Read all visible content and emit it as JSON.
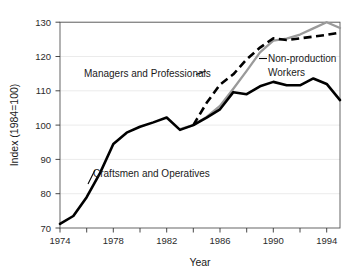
{
  "chart_data": {
    "type": "line",
    "title": "",
    "xlabel": "Year",
    "ylabel": "Index (1984=100)",
    "xlim": [
      1974,
      1995
    ],
    "ylim": [
      70,
      130
    ],
    "grid": true,
    "legend_position": "inline-annotations",
    "x_ticks_major": [
      1974,
      1978,
      1982,
      1986,
      1990,
      1994
    ],
    "x_ticks_minor": [
      1976,
      1980,
      1984,
      1988,
      1992
    ],
    "y_ticks": [
      70,
      80,
      90,
      100,
      110,
      120,
      130
    ],
    "series": [
      {
        "name": "Craftsmen and Operatives",
        "style": "solid",
        "color": "#000000",
        "x": [
          1974,
          1975,
          1976,
          1977,
          1978,
          1979,
          1980,
          1981,
          1982,
          1983,
          1984,
          1985,
          1986,
          1987,
          1988,
          1989,
          1990,
          1991,
          1992,
          1993,
          1994,
          1995
        ],
        "values": [
          71.2,
          73.5,
          79.0,
          86.0,
          94.5,
          97.8,
          99.5,
          100.8,
          102.2,
          98.6,
          100.0,
          102.2,
          104.6,
          109.6,
          109.0,
          111.3,
          112.6,
          111.6,
          111.6,
          113.6,
          112.0,
          107.3
        ]
      },
      {
        "name": "Managers and Professionals",
        "style": "dashed",
        "color": "#000000",
        "x": [
          1984,
          1985,
          1986,
          1987,
          1988,
          1989,
          1990,
          1991,
          1992,
          1993,
          1994,
          1995
        ],
        "values": [
          100.0,
          106.5,
          111.8,
          114.8,
          119.2,
          122.6,
          125.3,
          124.8,
          125.3,
          125.8,
          126.3,
          127.0
        ]
      },
      {
        "name": "Non-production Workers",
        "style": "solid",
        "color": "#9a9a9a",
        "x": [
          1983,
          1984,
          1985,
          1986,
          1987,
          1988,
          1989,
          1990,
          1991,
          1992,
          1993,
          1994,
          1995
        ],
        "values": [
          98.8,
          100.0,
          102.4,
          105.6,
          110.6,
          115.8,
          121.2,
          124.6,
          125.2,
          126.4,
          128.2,
          130.0,
          128.3
        ]
      }
    ],
    "annotations": [
      {
        "text": "Managers and Professionals",
        "x_px": 84,
        "y_px": 77
      },
      {
        "text": "Craftsmen and Operatives",
        "x_px": 93,
        "y_px": 177
      },
      {
        "text": "Non-production",
        "x_px": 268,
        "y_px": 62
      },
      {
        "text": "Workers",
        "x_px": 268,
        "y_px": 76
      }
    ]
  },
  "axes": {
    "y_tick_labels": [
      "130",
      "120",
      "110",
      "100",
      "90",
      "80",
      "70"
    ],
    "x_tick_labels": [
      "1974",
      "1978",
      "1982",
      "1986",
      "1990",
      "1994"
    ],
    "x_title": "Year",
    "y_title": "Index (1984=100)"
  }
}
